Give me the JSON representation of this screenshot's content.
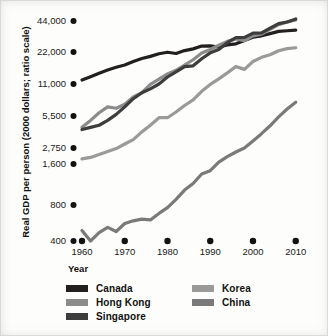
{
  "chart_data": {
    "type": "line",
    "title": "",
    "xlabel": "Year",
    "ylabel": "Real GDP per person (2000 dollars; ratio scale)",
    "scale": "log",
    "grid": false,
    "legend_position": "bottom",
    "xlim": [
      1960,
      2011
    ],
    "ylim": [
      400,
      50000
    ],
    "xticks": [
      1960,
      1970,
      1980,
      1990,
      2000,
      2010
    ],
    "xtick_labels": [
      "1960",
      "1970",
      "1980",
      "1990",
      "2000",
      "2010"
    ],
    "yticks": [
      400,
      800,
      1600,
      2750,
      5500,
      11000,
      22000,
      44000
    ],
    "ytick_labels": [
      "400",
      "800",
      "1,600",
      "2,750",
      "5,500",
      "11,000",
      "22,000",
      "44,000"
    ],
    "series": [
      {
        "name": "Canada",
        "color": "#231f20",
        "x": [
          1960,
          1962,
          1964,
          1966,
          1968,
          1970,
          1972,
          1974,
          1976,
          1978,
          1980,
          1982,
          1984,
          1986,
          1988,
          1990,
          1992,
          1994,
          1996,
          1998,
          2000,
          2002,
          2004,
          2006,
          2008,
          2010
        ],
        "values": [
          12000,
          12900,
          13900,
          14900,
          15800,
          16600,
          17900,
          19100,
          20000,
          21200,
          21900,
          21300,
          22700,
          23600,
          25100,
          25200,
          24600,
          25800,
          26400,
          28400,
          30600,
          31600,
          33200,
          34900,
          35400,
          35800
        ]
      },
      {
        "name": "Hong Kong",
        "color": "#8c8c8c",
        "x": [
          1960,
          1962,
          1964,
          1966,
          1968,
          1970,
          1972,
          1974,
          1976,
          1978,
          1980,
          1982,
          1984,
          1986,
          1988,
          1990,
          1992,
          1994,
          1996,
          1998,
          2000,
          2002,
          2004,
          2006,
          2008,
          2010
        ],
        "values": [
          4300,
          5000,
          5900,
          6700,
          6500,
          7100,
          8300,
          9100,
          10900,
          12200,
          13700,
          14800,
          16600,
          18600,
          21500,
          23300,
          25600,
          27900,
          29500,
          28300,
          31500,
          32800,
          36500,
          40500,
          43000,
          45000
        ]
      },
      {
        "name": "Singapore",
        "color": "#3d3d3d",
        "x": [
          1960,
          1962,
          1964,
          1966,
          1968,
          1970,
          1972,
          1974,
          1976,
          1978,
          1980,
          1982,
          1984,
          1986,
          1988,
          1990,
          1992,
          1994,
          1996,
          1998,
          2000,
          2002,
          2004,
          2006,
          2008,
          2010
        ],
        "values": [
          4100,
          4300,
          4500,
          5000,
          5700,
          6700,
          8000,
          9100,
          9900,
          11000,
          12800,
          14300,
          16000,
          16300,
          19000,
          21600,
          23300,
          27100,
          30300,
          30500,
          33500,
          33800,
          37500,
          41500,
          43000,
          46000
        ]
      },
      {
        "name": "Korea",
        "color": "#9a9a9a",
        "x": [
          1960,
          1962,
          1964,
          1966,
          1968,
          1970,
          1972,
          1974,
          1976,
          1978,
          1980,
          1982,
          1984,
          1986,
          1988,
          1990,
          1992,
          1994,
          1996,
          1998,
          2000,
          2002,
          2004,
          2006,
          2008,
          2010
        ],
        "values": [
          1900,
          2000,
          2200,
          2450,
          2700,
          3000,
          3300,
          3900,
          4500,
          5300,
          5300,
          6000,
          6900,
          7800,
          9400,
          10900,
          12300,
          14000,
          16100,
          15100,
          17900,
          19600,
          20700,
          22600,
          23700,
          24200
        ]
      },
      {
        "name": "China",
        "color": "#7a7a7a",
        "x": [
          1960,
          1962,
          1964,
          1966,
          1968,
          1970,
          1972,
          1974,
          1976,
          1978,
          1980,
          1982,
          1984,
          1986,
          1988,
          1990,
          1992,
          1994,
          1996,
          1998,
          2000,
          2002,
          2004,
          2006,
          2008,
          2010
        ],
        "values": [
          490,
          400,
          470,
          520,
          480,
          560,
          590,
          610,
          600,
          680,
          760,
          880,
          1030,
          1150,
          1350,
          1430,
          1700,
          2050,
          2400,
          2750,
          3200,
          3750,
          4450,
          5400,
          6400,
          7400
        ]
      }
    ]
  },
  "legend": {
    "columns": [
      {
        "items": [
          {
            "label": "Canada",
            "color": "#231f20"
          },
          {
            "label": "Hong Kong",
            "color": "#8c8c8c"
          },
          {
            "label": "Singapore",
            "color": "#3d3d3d"
          }
        ]
      },
      {
        "items": [
          {
            "label": "Korea",
            "color": "#9a9a9a"
          },
          {
            "label": "China",
            "color": "#7a7a7a"
          }
        ]
      }
    ]
  }
}
